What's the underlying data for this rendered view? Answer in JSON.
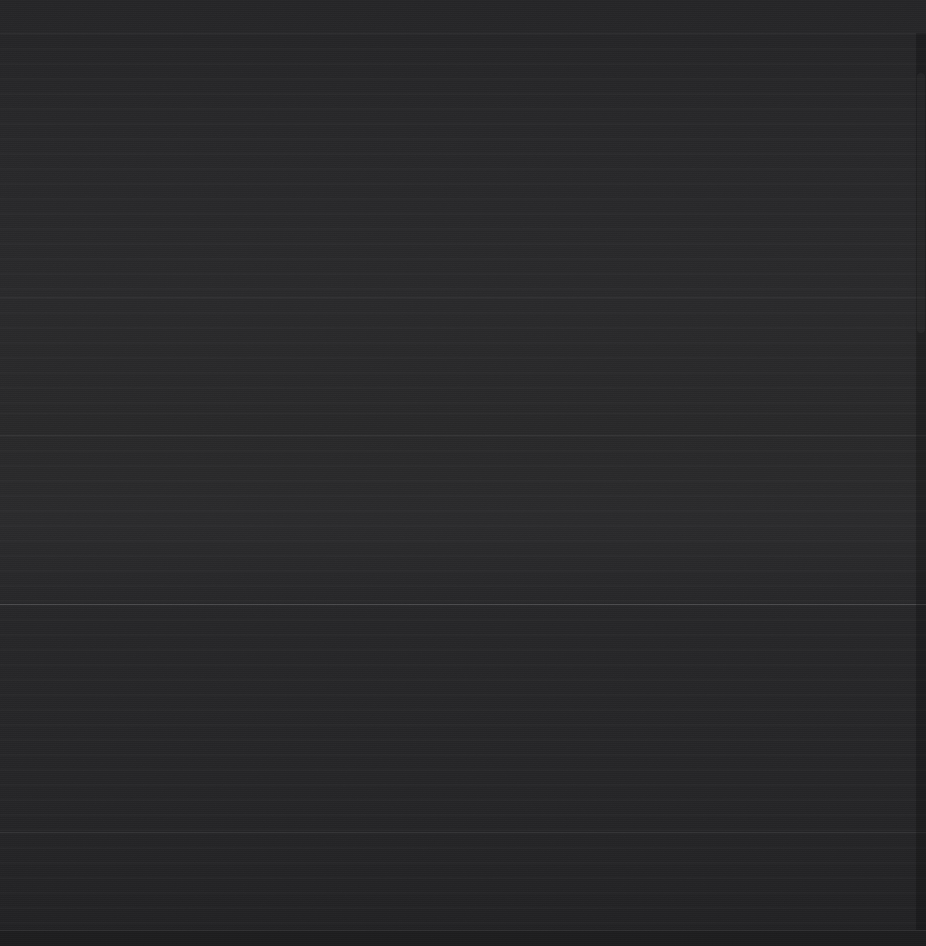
{
  "capture": {
    "width": 926,
    "height": 946,
    "description": "Application window captured at extremely low brightness; content is not legible.",
    "legibility": "none",
    "background_color": "#262628"
  },
  "colors": {
    "window_background": "#262628",
    "top_band": "#242426",
    "upper_mid_band": "#29292b",
    "mid_band": "#2a2a2c",
    "lower_band": "#232325",
    "bottom_band": "#212123",
    "divider_faint": "rgba(255,255,255,0.030)",
    "divider_medium": "rgba(255,255,255,0.055)",
    "divider_strong": "rgba(255,255,255,0.150)",
    "scrollbar_track": "rgba(0,0,0,0.22)",
    "scrollbar_thumb": "rgba(255,255,255,0.035)"
  },
  "top_bar": {
    "height": 33,
    "title": "",
    "visible_labels": []
  },
  "regions": [
    {
      "name": "top-bar-region",
      "top": 0,
      "height": 33,
      "label": ""
    },
    {
      "name": "upper-content-region",
      "top": 33,
      "height": 264,
      "label": ""
    },
    {
      "name": "section-two-region",
      "top": 297,
      "height": 116,
      "label": ""
    },
    {
      "name": "section-three-region",
      "top": 413,
      "height": 22,
      "label": ""
    },
    {
      "name": "section-four-region",
      "top": 435,
      "height": 169,
      "label": ""
    },
    {
      "name": "main-lower-region",
      "top": 604,
      "height": 228,
      "label": ""
    },
    {
      "name": "sub-lower-region",
      "top": 832,
      "height": 98,
      "label": ""
    },
    {
      "name": "status-bar-region",
      "top": 930,
      "height": 16,
      "label": ""
    }
  ],
  "dividers": [
    {
      "name": "top-bar-divider",
      "y": 33,
      "weight": "faint"
    },
    {
      "name": "section-divider-1",
      "y": 297,
      "weight": "faint"
    },
    {
      "name": "section-divider-2",
      "y": 413,
      "weight": "faint"
    },
    {
      "name": "section-divider-3",
      "y": 435,
      "weight": "medium"
    },
    {
      "name": "primary-section-divider",
      "y": 604,
      "weight": "strong"
    },
    {
      "name": "section-divider-4",
      "y": 832,
      "weight": "medium"
    },
    {
      "name": "status-bar-divider",
      "y": 930,
      "weight": "footer"
    }
  ],
  "scrollbar": {
    "name": "vertical-scrollbar",
    "track_top": 33,
    "track_height": 897,
    "track_width": 10,
    "thumb_top": 40,
    "thumb_height": 260
  },
  "status_bar": {
    "height": 16,
    "text": ""
  }
}
